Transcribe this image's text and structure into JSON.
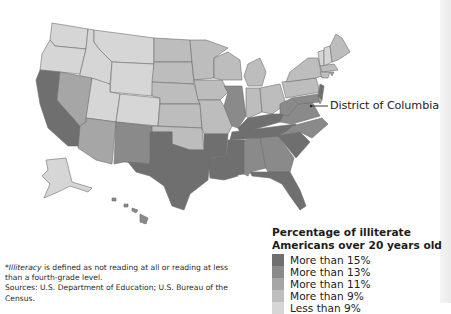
{
  "map": {
    "callout_label": "District of Columbia",
    "regions_note": "United States by state, shaded by percentage of illiterate adults"
  },
  "legend": {
    "title_line1": "Percentage of illiterate",
    "title_line2": "Americans over 20 years old",
    "items": [
      {
        "label": "More than 15%",
        "color": "#6f6f6f"
      },
      {
        "label": "More than 13%",
        "color": "#8a8a8a"
      },
      {
        "label": "More than 11%",
        "color": "#a6a6a6"
      },
      {
        "label": "More than 9%",
        "color": "#bdbdbd"
      },
      {
        "label": "Less than 9%",
        "color": "#d6d6d6"
      }
    ]
  },
  "footnote": {
    "term": "Illiteracy",
    "definition_prefix": "*",
    "definition_rest": " is defined as not reading at all or reading at less than a fourth-grade level.",
    "sources": "Sources: U.S. Department of Education; U.S. Bureau of the Census."
  },
  "colors": {
    "c15": "#6f6f6f",
    "c13": "#8a8a8a",
    "c11": "#a6a6a6",
    "c9": "#bdbdbd",
    "clt9": "#d6d6d6",
    "border": "#6d6d6d"
  }
}
